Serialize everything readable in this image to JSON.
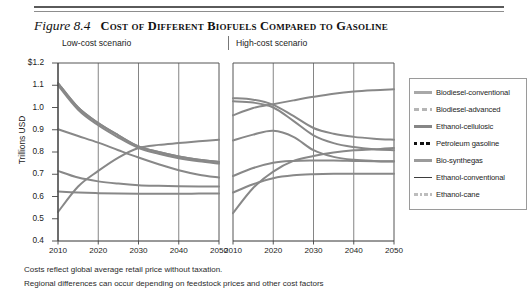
{
  "figure": {
    "number": "Figure 8.4",
    "title": "Cost of Different Biofuels Compared to Gasoline"
  },
  "panels": [
    {
      "key": "low",
      "label": "Low-cost scenario"
    },
    {
      "key": "high",
      "label": "High-cost scenario"
    }
  ],
  "axes": {
    "ylabel": "Trillions USD",
    "yticks": [
      "$1.2",
      "1.1",
      "1.0",
      "0.9",
      "0.8",
      "0.7",
      "0.6",
      "0.5",
      "0.4"
    ],
    "ytick_values": [
      1.2,
      1.1,
      1.0,
      0.9,
      0.8,
      0.7,
      0.6,
      0.5,
      0.4
    ],
    "xticks": [
      "2010",
      "2020",
      "2030",
      "2040",
      "2050"
    ],
    "xtick_values": [
      2010,
      2020,
      2030,
      2040,
      2050
    ]
  },
  "legend": {
    "items": [
      {
        "label": "Biodiesel-conventional",
        "color": "#a8a8a8",
        "style": "solid",
        "width": 2.6,
        "swatch": "solid-line-swatch"
      },
      {
        "label": "Biodiesel-advanced",
        "color": "#b5b5b5",
        "style": "dashed",
        "width": 2.4,
        "swatch": "dashed-line-swatch"
      },
      {
        "label": "Ethanol-cellulosic",
        "color": "#868686",
        "style": "solid",
        "width": 2.6,
        "swatch": "solid-line-swatch"
      },
      {
        "label": "Petroleum gasoline",
        "color": "#111111",
        "style": "dotted",
        "width": 3.4,
        "swatch": "dotted-line-swatch"
      },
      {
        "label": "Bio-synthegas",
        "color": "#9b9b9b",
        "style": "solid",
        "width": 2.4,
        "swatch": "solid-line-swatch"
      },
      {
        "label": "Ethanol-conventional",
        "color": "#3d3d3d",
        "style": "solid",
        "width": 1.2,
        "swatch": "solid-line-swatch"
      },
      {
        "label": "Ethanol-cane",
        "color": "#bdbdbd",
        "style": "dashdot",
        "width": 2.2,
        "swatch": "dashdot-line-swatch"
      }
    ]
  },
  "notes": [
    "Costs reflect global average retail price without taxation.",
    "Regional differences can occur depending on feedstock prices and other cost factors"
  ],
  "chart_data": {
    "type": "line",
    "title": "Cost of Different Biofuels Compared to Gasoline",
    "xlabel": "",
    "ylabel": "Trillions USD",
    "ylim": [
      0.4,
      1.2
    ],
    "xlim": [
      2010,
      2050
    ],
    "grid": "vertical",
    "legend_position": "right",
    "panels": [
      {
        "name": "Low-cost scenario",
        "x": [
          2010,
          2015,
          2020,
          2025,
          2030,
          2035,
          2040,
          2045,
          2050
        ],
        "series": [
          {
            "name": "Biodiesel-conventional",
            "values": [
              1.11,
              1.0,
              0.93,
              0.875,
              0.825,
              0.8,
              0.78,
              0.765,
              0.755
            ]
          },
          {
            "name": "Biodiesel-advanced",
            "values": [
              1.1,
              0.99,
              0.92,
              0.865,
              0.818,
              0.792,
              0.772,
              0.758,
              0.748
            ]
          },
          {
            "name": "Ethanol-cellulosic",
            "values": [
              1.11,
              1.0,
              0.93,
              0.875,
              0.825,
              0.8,
              0.78,
              0.765,
              0.755
            ]
          },
          {
            "name": "Petroleum gasoline",
            "values": [
              0.53,
              0.645,
              0.715,
              0.775,
              0.818,
              0.832,
              0.84,
              0.848,
              0.855
            ]
          },
          {
            "name": "Bio-synthegas",
            "values": [
              0.715,
              0.685,
              0.668,
              0.658,
              0.651,
              0.648,
              0.646,
              0.645,
              0.645
            ]
          },
          {
            "name": "Ethanol-conventional",
            "values": [
              0.902,
              0.872,
              0.842,
              0.808,
              0.775,
              0.745,
              0.718,
              0.698,
              0.685
            ]
          },
          {
            "name": "Ethanol-cane",
            "values": [
              0.622,
              0.618,
              0.615,
              0.613,
              0.612,
              0.612,
              0.612,
              0.613,
              0.614
            ]
          }
        ]
      },
      {
        "name": "High-cost scenario",
        "x": [
          2010,
          2015,
          2020,
          2025,
          2030,
          2035,
          2040,
          2045,
          2050
        ],
        "series": [
          {
            "name": "Biodiesel-conventional",
            "values": [
              0.965,
              0.998,
              1.015,
              1.032,
              1.048,
              1.062,
              1.072,
              1.078,
              1.082
            ]
          },
          {
            "name": "Biodiesel-advanced",
            "values": [
              1.042,
              1.035,
              1.012,
              0.962,
              0.908,
              0.882,
              0.868,
              0.86,
              0.855
            ]
          },
          {
            "name": "Ethanol-cellulosic",
            "values": [
              1.028,
              1.022,
              1.0,
              0.94,
              0.875,
              0.84,
              0.822,
              0.812,
              0.808
            ]
          },
          {
            "name": "Petroleum gasoline",
            "values": [
              0.525,
              0.638,
              0.712,
              0.76,
              0.782,
              0.798,
              0.808,
              0.812,
              0.818
            ]
          },
          {
            "name": "Bio-synthegas",
            "values": [
              0.692,
              0.728,
              0.752,
              0.76,
              0.762,
              0.762,
              0.76,
              0.758,
              0.757
            ]
          },
          {
            "name": "Ethanol-conventional",
            "values": [
              0.852,
              0.878,
              0.895,
              0.868,
              0.808,
              0.778,
              0.765,
              0.76,
              0.758
            ]
          },
          {
            "name": "Ethanol-cane",
            "values": [
              0.618,
              0.655,
              0.682,
              0.695,
              0.7,
              0.702,
              0.702,
              0.702,
              0.702
            ]
          }
        ]
      }
    ]
  }
}
